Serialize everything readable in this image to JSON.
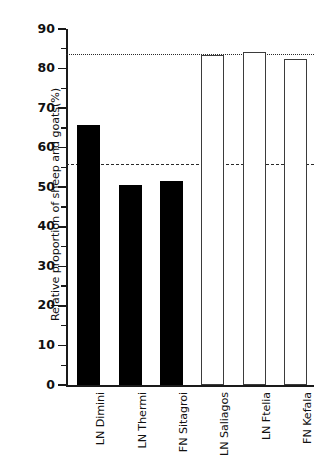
{
  "chart_data": {
    "type": "bar",
    "title": "",
    "subtitle": "",
    "xlabel": "",
    "ylabel": "Relative proportion of sheep and goats(%)",
    "ylim": [
      0,
      90
    ],
    "xlim": [
      0,
      6
    ],
    "grid": false,
    "legend": "none",
    "y_ticks_major": [
      0,
      10,
      20,
      30,
      40,
      50,
      60,
      70,
      80,
      90
    ],
    "y_ticks_minor": [
      5,
      15,
      25,
      35,
      45,
      55,
      65,
      75,
      85
    ],
    "y_tick_labels": [
      "0",
      "10",
      "20",
      "30",
      "40",
      "50",
      "60",
      "70",
      "80",
      "90"
    ],
    "categories": [
      "LN Dimini",
      "LN Thermi",
      "FN Sitagroi",
      "LN Saliagos",
      "LN Ftelia",
      "FN Kefala"
    ],
    "values": [
      65.7,
      50.6,
      51.6,
      83.4,
      84.3,
      82.3
    ],
    "bar_styles": [
      "filled",
      "filled",
      "filled",
      "open",
      "open",
      "open"
    ],
    "bars": [
      {
        "label": "LN Dimini",
        "value": 65.7,
        "style": "filled",
        "fill": "#000000",
        "edge": "#000000"
      },
      {
        "label": "LN Thermi",
        "value": 50.6,
        "style": "filled",
        "fill": "#000000",
        "edge": "#000000"
      },
      {
        "label": "FN Sitagroi",
        "value": 51.6,
        "style": "filled",
        "fill": "#000000",
        "edge": "#000000"
      },
      {
        "label": "LN Saliagos",
        "value": 83.4,
        "style": "open",
        "fill": "#ffffff",
        "edge": "#3b3b3b"
      },
      {
        "label": "LN Ftelia",
        "value": 84.3,
        "style": "open",
        "fill": "#ffffff",
        "edge": "#3b3b3b"
      },
      {
        "label": "FN Kefala",
        "value": 82.3,
        "style": "open",
        "fill": "#ffffff",
        "edge": "#3b3b3b"
      }
    ],
    "reference_lines": [
      {
        "name": "mainland-mean",
        "value": 55.8,
        "style": "dashed",
        "color": "#2a2a2a"
      },
      {
        "name": "islands-mean",
        "value": 83.8,
        "style": "dotted",
        "color": "#2a2a2a"
      }
    ],
    "colors": {
      "axis": "#1a1a1a",
      "text": "#111111",
      "filled_bar": "#000000",
      "open_bar_edge": "#3b3b3b",
      "background": "#ffffff"
    }
  }
}
